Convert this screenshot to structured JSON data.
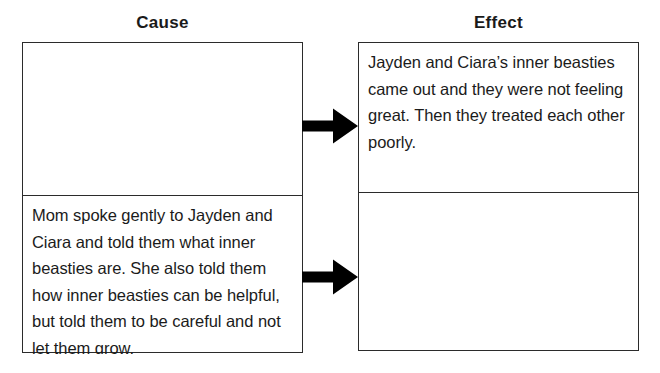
{
  "worksheet": {
    "title": "Cause and Effect graphic organizer",
    "columns": [
      {
        "heading": "Cause",
        "cells": [
          {
            "text": "",
            "filled": false
          },
          {
            "text": "Mom spoke gently to Jayden and Ciara and told them what inner beasties are. She also told them how inner beasties can be helpful, but told them to be careful and not let them grow.",
            "filled": true
          }
        ]
      },
      {
        "heading": "Effect",
        "cells": [
          {
            "text": "Jayden and Ciara’s inner beasties came out and they were not feeling great. Then they treated each other poorly.",
            "filled": true
          },
          {
            "text": "",
            "filled": false
          }
        ]
      }
    ],
    "connectors": [
      {
        "name": "arrow-top",
        "direction": "right",
        "from": "cause-cell-1",
        "to": "effect-cell-1"
      },
      {
        "name": "arrow-bottom",
        "direction": "right",
        "from": "cause-cell-2",
        "to": "effect-cell-2"
      }
    ],
    "colors": {
      "border": "#2b2b2b",
      "text": "#1b1b1b",
      "arrow": "#000000",
      "background": "#ffffff"
    }
  }
}
